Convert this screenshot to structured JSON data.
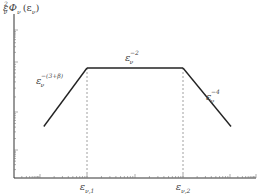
{
  "chart_data": {
    "type": "line",
    "title": "",
    "ylabel": "ε_ν² Φ_ν(ε_ν)",
    "ylabel_parts": {
      "base": "ε",
      "sub": "ν",
      "sup": "2",
      "func": "Φ",
      "func_sub": "ν",
      "arg": "(ε",
      "arg_sub": "ν",
      "close": ")"
    },
    "xlabel": "",
    "x_scale": "log",
    "y_scale": "log",
    "x_ticks": [
      {
        "base": "ε",
        "sub": "ν,1",
        "x": 1
      },
      {
        "base": "ε",
        "sub": "ν,2",
        "x": 2
      }
    ],
    "xlim": [
      0,
      3.5
    ],
    "ylim": [
      0,
      3.5
    ],
    "series": [
      {
        "name": "ε_ν^-(3+β)",
        "points": [
          [
            0.55,
            1.1
          ],
          [
            1,
            2.35
          ]
        ]
      },
      {
        "name": "ε_ν^-2",
        "points": [
          [
            1,
            2.35
          ],
          [
            2,
            2.35
          ]
        ]
      },
      {
        "name": "ε_ν^-4",
        "points": [
          [
            2,
            2.35
          ],
          [
            2.5,
            1.1
          ]
        ]
      }
    ],
    "break_lines": [
      1,
      2
    ],
    "annotations": [
      {
        "base": "ε",
        "sub": "ν",
        "sup": "−(3+β)",
        "segment": 0
      },
      {
        "base": "ε",
        "sub": "ν",
        "sup": "−2",
        "segment": 1
      },
      {
        "base": "ε",
        "sub": "ν",
        "sup": "−4",
        "segment": 2
      }
    ],
    "grid": false,
    "legend": "none"
  }
}
